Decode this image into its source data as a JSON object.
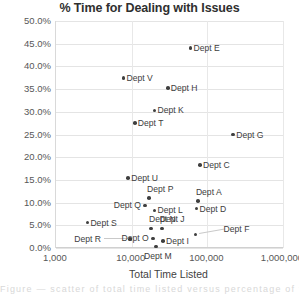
{
  "chart_data": {
    "type": "scatter",
    "title": "% Time for Dealing with Issues",
    "xlabel": "Total Time Listed",
    "ylabel": "",
    "xscale": "log",
    "xlim": [
      1000,
      1000000
    ],
    "ylim": [
      0.0,
      0.5
    ],
    "grid": true,
    "legend": "none",
    "xticks": [
      "1,000",
      "10,000",
      "100,000",
      "1,000,000"
    ],
    "xtick_values": [
      1000,
      10000,
      100000,
      1000000
    ],
    "yticks": [
      "0.0%",
      "5.0%",
      "10.0%",
      "15.0%",
      "20.0%",
      "25.0%",
      "30.0%",
      "35.0%",
      "40.0%",
      "45.0%",
      "50.0%"
    ],
    "ytick_values": [
      0,
      5,
      10,
      15,
      20,
      25,
      30,
      35,
      40,
      45,
      50
    ],
    "points": [
      {
        "label": "Dept E",
        "x": 60000,
        "y": 44.0,
        "label_side": "right"
      },
      {
        "label": "Dept V",
        "x": 7800,
        "y": 37.5,
        "label_side": "right"
      },
      {
        "label": "Dept H",
        "x": 30000,
        "y": 35.3,
        "label_side": "right"
      },
      {
        "label": "Dept K",
        "x": 20000,
        "y": 30.3,
        "label_side": "right"
      },
      {
        "label": "Dept T",
        "x": 11000,
        "y": 27.5,
        "label_side": "right"
      },
      {
        "label": "Dept G",
        "x": 220000,
        "y": 25.0,
        "label_side": "right"
      },
      {
        "label": "Dept C",
        "x": 80000,
        "y": 18.3,
        "label_side": "right"
      },
      {
        "label": "Dept U",
        "x": 9000,
        "y": 15.4,
        "label_side": "right"
      },
      {
        "label": "Dept P",
        "x": 17000,
        "y": 11.0,
        "label_side": "above"
      },
      {
        "label": "Dept A",
        "x": 75000,
        "y": 10.3,
        "label_side": "above"
      },
      {
        "label": "Dept Q",
        "x": 15000,
        "y": 9.4,
        "label_side": "left"
      },
      {
        "label": "Dept D",
        "x": 72000,
        "y": 8.7,
        "label_side": "right"
      },
      {
        "label": "Dept L",
        "x": 20000,
        "y": 8.3,
        "label_side": "right"
      },
      {
        "label": "Dept S",
        "x": 2600,
        "y": 5.6,
        "label_side": "right"
      },
      {
        "label": "Dept N",
        "x": 18000,
        "y": 4.3,
        "label_side": "above"
      },
      {
        "label": "Dept J",
        "x": 25000,
        "y": 4.3,
        "label_side": "above"
      },
      {
        "label": "Dept F",
        "x": 70000,
        "y": 3.0,
        "label_side": "leader"
      },
      {
        "label": "Dept R",
        "x": 9500,
        "y": 2.0,
        "label_side": "leader-left"
      },
      {
        "label": "Dept O",
        "x": 19000,
        "y": 2.1,
        "label_side": "left"
      },
      {
        "label": "Dept I",
        "x": 26000,
        "y": 1.6,
        "label_side": "right"
      },
      {
        "label": "Dept M",
        "x": 21000,
        "y": 0.3,
        "label_side": "below"
      }
    ]
  },
  "colors": {
    "marker": "#3f3f3f",
    "grid": "#e4e4e4",
    "text": "#3d3d3d",
    "axis": "#d0d0d0"
  },
  "footer": {
    "smudge_text": "Figure  — scatter of total time listed versus percentage of time"
  }
}
